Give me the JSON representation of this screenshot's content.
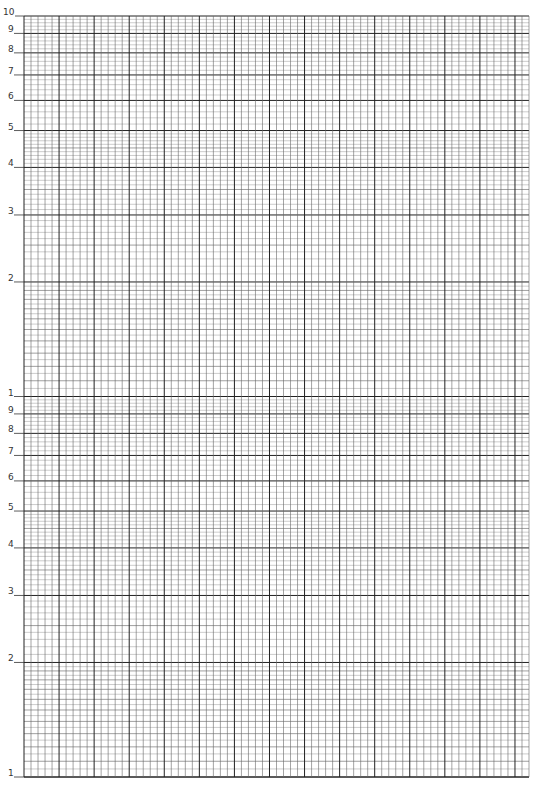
{
  "paper": {
    "type": "semi-log graph paper",
    "cycles": 2,
    "grid_left": 24,
    "grid_right": 529,
    "grid_top": 16,
    "grid_bottom": 777,
    "vertical_spacing": 7.05,
    "vertical_major_every": 5,
    "line_color": "#555555",
    "major_color": "#222222"
  },
  "axis_labels": {
    "decade_top": [
      "10",
      "9",
      "8",
      "7",
      "6",
      "5",
      "4",
      "3",
      "2"
    ],
    "decade_bottom": [
      "1",
      "9",
      "8",
      "7",
      "6",
      "5",
      "4",
      "3",
      "2",
      "1"
    ]
  },
  "decade_values": [
    10,
    9,
    8,
    7,
    6,
    5,
    4,
    3,
    2
  ]
}
